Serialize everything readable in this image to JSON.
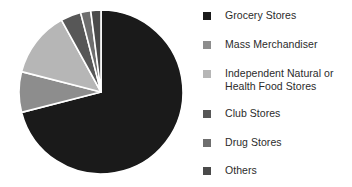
{
  "chart_data": {
    "type": "pie",
    "title": "",
    "subtitle": "",
    "xlabel": "",
    "ylabel": "",
    "grid": false,
    "legend_position": "right",
    "start_angle_deg": 0,
    "direction": "clockwise",
    "categories": [
      "Grocery Stores",
      "Mass Merchandiser",
      "Independent Natural or Health Food Stores",
      "Club Stores",
      "Drug Stores",
      "Others"
    ],
    "values": [
      71.0,
      8.0,
      13.0,
      4.0,
      2.0,
      2.0
    ],
    "slice_colors": [
      "#1a1a1a",
      "#8d8d8d",
      "#b6b6b6",
      "#575757",
      "#6e6e6e",
      "#4a4a4a"
    ],
    "separator_color": "#ffffff",
    "annotations": []
  },
  "legend": {
    "items": [
      {
        "label": "Grocery Stores",
        "color": "#1a1a1a"
      },
      {
        "label": "Mass Merchandiser",
        "color": "#8d8d8d"
      },
      {
        "label": "Independent Natural or\nHealth Food Stores",
        "color": "#b6b6b6"
      },
      {
        "label": "Club Stores",
        "color": "#575757"
      },
      {
        "label": "Drug Stores",
        "color": "#6e6e6e"
      },
      {
        "label": "Others",
        "color": "#4a4a4a"
      }
    ]
  }
}
